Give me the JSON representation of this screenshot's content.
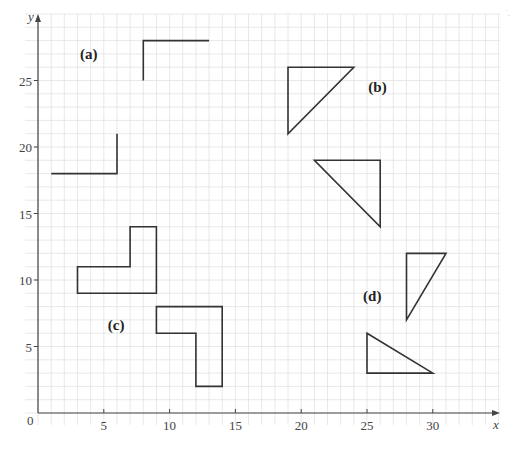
{
  "figure": {
    "type": "coordinate-grid-diagram",
    "axes": {
      "x_label": "x",
      "y_label": "y",
      "origin_label": "0",
      "x_range": [
        0,
        35
      ],
      "y_range": [
        0,
        30
      ],
      "x_ticks": [
        5,
        10,
        15,
        20,
        25,
        30
      ],
      "y_ticks": [
        5,
        10,
        15,
        20,
        25
      ],
      "grid_step": 1
    },
    "corner_mark": "˙․",
    "parts": [
      {
        "label": "(a)",
        "label_pos": [
          3.2,
          27
        ],
        "shapes": [
          {
            "kind": "polyline",
            "points": [
              [
                1,
                18
              ],
              [
                6,
                18
              ],
              [
                6,
                21
              ]
            ]
          },
          {
            "kind": "polyline",
            "points": [
              [
                8,
                25
              ],
              [
                8,
                28
              ],
              [
                13,
                28
              ]
            ]
          }
        ]
      },
      {
        "label": "(b)",
        "label_pos": [
          25.1,
          24.5
        ],
        "shapes": [
          {
            "kind": "polygon",
            "points": [
              [
                19,
                26
              ],
              [
                24,
                26
              ],
              [
                19,
                21
              ]
            ]
          },
          {
            "kind": "polygon",
            "points": [
              [
                21,
                19
              ],
              [
                26,
                19
              ],
              [
                26,
                14
              ]
            ]
          }
        ]
      },
      {
        "label": "(c)",
        "label_pos": [
          5.3,
          6.6
        ],
        "shapes": [
          {
            "kind": "polygon",
            "points": [
              [
                3,
                9
              ],
              [
                9,
                9
              ],
              [
                9,
                14
              ],
              [
                7,
                14
              ],
              [
                7,
                11
              ],
              [
                3,
                11
              ]
            ]
          },
          {
            "kind": "polygon",
            "points": [
              [
                9,
                8
              ],
              [
                14,
                8
              ],
              [
                14,
                2
              ],
              [
                12,
                2
              ],
              [
                12,
                6
              ],
              [
                9,
                6
              ]
            ]
          }
        ]
      },
      {
        "label": "(d)",
        "label_pos": [
          24.7,
          8.8
        ],
        "shapes": [
          {
            "kind": "polygon",
            "points": [
              [
                28,
                12
              ],
              [
                31,
                12
              ],
              [
                28,
                7
              ]
            ]
          },
          {
            "kind": "polygon",
            "points": [
              [
                25,
                6
              ],
              [
                25,
                3
              ],
              [
                30,
                3
              ]
            ]
          }
        ]
      }
    ],
    "colors": {
      "grid": "#e2e2e2",
      "axis": "#444444",
      "shape_stroke": "#333333",
      "label": "#222222"
    }
  }
}
